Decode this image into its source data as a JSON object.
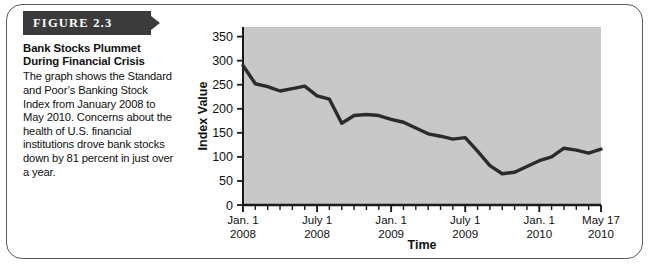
{
  "figure": {
    "banner_label": "FIGURE 2.3",
    "title": "Bank Stocks Plummet During Financial Crisis",
    "body": "The graph shows the Standard and Poor’s Banking Stock Index from January 2008 to May 2010.  Concerns about the health of U.S. financial institutions drove bank stocks down by 81 percent in just over a year."
  },
  "colors": {
    "banner_background": "#3b3b3b",
    "banner_text": "#ffffff",
    "plot_background": "#c8c8c8",
    "line": "#2b2b2b",
    "axis": "#1a1a1a",
    "card_border": "#5b5b5b",
    "page_background": "#ffffff"
  },
  "chart_data": {
    "type": "line",
    "title": "",
    "xlabel": "Time",
    "ylabel": "Index Value",
    "ylim": [
      0,
      370
    ],
    "yticks": [
      0,
      50,
      100,
      150,
      200,
      250,
      300,
      350
    ],
    "ytick_labels": [
      "0",
      "50",
      "100",
      "150",
      "200",
      "250",
      "300",
      "350"
    ],
    "xlim": [
      0,
      29
    ],
    "xtick_positions": [
      0,
      6,
      12,
      18,
      24,
      29
    ],
    "xtick_labels": [
      {
        "line1": "Jan. 1",
        "line2": "2008"
      },
      {
        "line1": "July 1",
        "line2": "2008"
      },
      {
        "line1": "Jan. 1",
        "line2": "2009"
      },
      {
        "line1": "July 1",
        "line2": "2009"
      },
      {
        "line1": "Jan. 1",
        "line2": "2010"
      },
      {
        "line1": "May 17",
        "line2": "2010"
      }
    ],
    "minor_tick_count": 29,
    "grid": false,
    "legend": false,
    "series": [
      {
        "name": "S&P Banking Stock Index",
        "x": [
          0,
          1,
          2,
          3,
          4,
          5,
          6,
          7,
          8,
          9,
          10,
          11,
          12,
          13,
          14,
          15,
          16,
          17,
          18,
          19,
          20,
          21,
          22,
          23,
          24,
          25,
          26,
          27,
          28,
          29
        ],
        "values": [
          290,
          252,
          246,
          237,
          242,
          247,
          227,
          220,
          170,
          186,
          188,
          186,
          178,
          172,
          160,
          148,
          143,
          137,
          140,
          112,
          82,
          65,
          68,
          80,
          92,
          100,
          118,
          114,
          108,
          116
        ]
      }
    ],
    "annotation_values": {
      "start_value": 290,
      "trough_value": 65,
      "end_value": 152,
      "percent_decline": 81
    }
  }
}
